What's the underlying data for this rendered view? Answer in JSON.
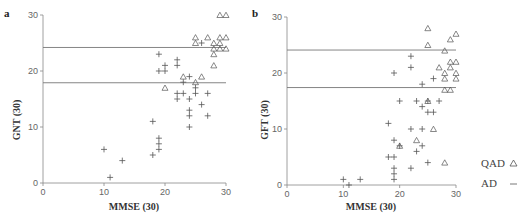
{
  "chart_data": [
    {
      "panel": "a",
      "type": "scatter",
      "title": "",
      "xlabel": "MMSE (30)",
      "ylabel": "GNT (30)",
      "xlim": [
        0,
        30
      ],
      "ylim": [
        0,
        30
      ],
      "xticks": [
        0,
        10,
        20,
        30
      ],
      "yticks": [
        0,
        10,
        20,
        30
      ],
      "grid": false,
      "hlines": [
        24.2,
        17.9
      ],
      "series": [
        {
          "name": "QAD",
          "marker": "triangle",
          "points": [
            [
              29,
              30
            ],
            [
              30,
              30
            ],
            [
              25,
              26
            ],
            [
              27,
              26
            ],
            [
              29,
              26
            ],
            [
              30,
              26
            ],
            [
              25,
              25
            ],
            [
              28,
              25
            ],
            [
              29,
              25
            ],
            [
              28,
              24
            ],
            [
              29,
              24
            ],
            [
              30,
              24
            ],
            [
              28,
              23
            ],
            [
              28,
              21
            ],
            [
              23,
              19
            ],
            [
              26,
              19
            ],
            [
              25,
              18
            ],
            [
              20,
              17
            ]
          ]
        },
        {
          "name": "AD",
          "marker": "plus",
          "points": [
            [
              26,
              25
            ],
            [
              19,
              23
            ],
            [
              22,
              22
            ],
            [
              22,
              21
            ],
            [
              20,
              21
            ],
            [
              19,
              20
            ],
            [
              20,
              20
            ],
            [
              24,
              19
            ],
            [
              23,
              18
            ],
            [
              25,
              17
            ],
            [
              22,
              16
            ],
            [
              23,
              16
            ],
            [
              25,
              16
            ],
            [
              27,
              16
            ],
            [
              22,
              15
            ],
            [
              24,
              15
            ],
            [
              26,
              14
            ],
            [
              24,
              13
            ],
            [
              24,
              12
            ],
            [
              27,
              12
            ],
            [
              18,
              11
            ],
            [
              24,
              10
            ],
            [
              19,
              8
            ],
            [
              19,
              7
            ],
            [
              19,
              6
            ],
            [
              10,
              6
            ],
            [
              18,
              5
            ],
            [
              13,
              4
            ],
            [
              11,
              1
            ]
          ]
        }
      ]
    },
    {
      "panel": "b",
      "type": "scatter",
      "title": "",
      "xlabel": "MMSE (30)",
      "ylabel": "GFT (30)",
      "xlim": [
        0,
        30
      ],
      "ylim": [
        0,
        30
      ],
      "xticks": [
        0,
        10,
        20,
        30
      ],
      "yticks": [
        0,
        10,
        20,
        30
      ],
      "grid": false,
      "hlines": [
        24.1,
        17.4
      ],
      "series": [
        {
          "name": "QAD",
          "marker": "triangle",
          "points": [
            [
              25,
              28
            ],
            [
              30,
              27
            ],
            [
              29,
              26
            ],
            [
              25,
              25
            ],
            [
              28,
              24
            ],
            [
              29,
              22
            ],
            [
              30,
              22
            ],
            [
              27,
              21
            ],
            [
              29,
              21
            ],
            [
              28,
              20
            ],
            [
              30,
              20
            ],
            [
              28,
              19
            ],
            [
              30,
              19
            ],
            [
              28,
              17
            ],
            [
              29,
              17
            ],
            [
              25,
              15
            ],
            [
              26,
              10
            ],
            [
              23,
              8
            ],
            [
              20,
              7
            ],
            [
              28,
              4
            ]
          ]
        },
        {
          "name": "AD",
          "marker": "plus",
          "points": [
            [
              22,
              23
            ],
            [
              22,
              21
            ],
            [
              19,
              20
            ],
            [
              26,
              19
            ],
            [
              24,
              18
            ],
            [
              20,
              15
            ],
            [
              23,
              15
            ],
            [
              25,
              15
            ],
            [
              27,
              15
            ],
            [
              24,
              14
            ],
            [
              25,
              13
            ],
            [
              26,
              13
            ],
            [
              18,
              11
            ],
            [
              22,
              10
            ],
            [
              24,
              10
            ],
            [
              19,
              8
            ],
            [
              20,
              7
            ],
            [
              24,
              7
            ],
            [
              23,
              6
            ],
            [
              18,
              5
            ],
            [
              19,
              5
            ],
            [
              25,
              4
            ],
            [
              19,
              3
            ],
            [
              22,
              3
            ],
            [
              19,
              2
            ],
            [
              19,
              1
            ],
            [
              10,
              1
            ],
            [
              13,
              1
            ],
            [
              11,
              0
            ]
          ]
        }
      ]
    }
  ],
  "legend": {
    "position": "right-bottom",
    "entries": [
      {
        "label": "QAD",
        "marker": "triangle"
      },
      {
        "label": "AD",
        "marker": "dash"
      }
    ]
  },
  "panels": {
    "a": {
      "label": "a",
      "xlabel": "MMSE (30)",
      "ylabel": "GNT (30)"
    },
    "b": {
      "label": "b",
      "xlabel": "MMSE (30)",
      "ylabel": "GFT (30)"
    }
  },
  "colors": {
    "axis": "#888888",
    "refline": "#777777",
    "marker": "#555555"
  }
}
